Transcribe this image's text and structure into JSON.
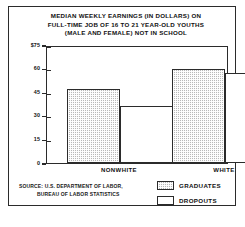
{
  "chart_data": {
    "type": "bar",
    "title": "MEDIAN WEEKLY EARNINGS (IN DOLLARS) ON FULL-TIME JOB OF 16 TO 21 YEAR-OLD YOUTHS (MALE AND FEMALE) NOT IN SCHOOL",
    "title_lines": [
      "MEDIAN WEEKLY EARNINGS (IN DOLLARS) ON",
      "FULL-TIME JOB OF 16 TO 21 YEAR-OLD YOUTHS",
      "(MALE AND FEMALE) NOT IN SCHOOL"
    ],
    "categories": [
      "NONWHITE",
      "WHITE"
    ],
    "series": [
      {
        "name": "GRADUATES",
        "values": [
          47,
          60
        ],
        "fill": "hatched"
      },
      {
        "name": "DROPOUTS",
        "values": [
          36,
          57
        ],
        "fill": "white"
      }
    ],
    "xlabel": "",
    "ylabel": "",
    "ylim": [
      0,
      75
    ],
    "yticks": [
      0,
      15,
      30,
      45,
      60,
      75
    ],
    "ytick_labels": [
      "0",
      "15",
      "30",
      "45",
      "60",
      "$75"
    ],
    "grid": false,
    "legend_position": "bottom-right",
    "source_lines": [
      "SOURCE: U.S. DEPARTMENT OF LABOR,",
      "BUREAU OF LABOR STATISTICS"
    ],
    "colors": {
      "axis": "#2b2b2b",
      "graduates_fill": "#b9b9b9",
      "dropouts_fill": "#ffffff",
      "background": "#ffffff"
    }
  }
}
